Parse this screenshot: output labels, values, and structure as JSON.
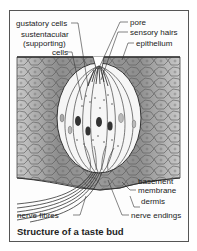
{
  "diagram": {
    "title": "Structure of a taste bud",
    "labels": {
      "gustatory_cells": "gustatory cells",
      "sustentacular_1": "sustentacular",
      "sustentacular_2": "(supporting)",
      "sustentacular_3": "cells",
      "pore": "pore",
      "sensory_hairs": "sensory hairs",
      "epithelium": "epithelium",
      "basement_1": "basement",
      "basement_2": "membrane",
      "dermis": "dermis",
      "nerve_fibres": "nerve fibres",
      "nerve_endings": "nerve endings"
    },
    "colors": {
      "tissue": "#8a8a8a",
      "tissue_light": "#b5b5b5",
      "outline": "#333333",
      "bud_fill": "#f4f4f4"
    }
  }
}
